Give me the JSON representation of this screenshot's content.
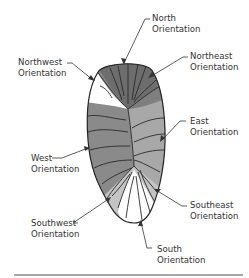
{
  "diagram": {
    "colors": {
      "north": "#6d6d6d",
      "northwest": "#ffffff",
      "northeast": "#8e8e8e",
      "west": "#8a8a8a",
      "east": "#a8a8a8",
      "southwest": "#c4c4c4",
      "southeast": "#c4c4c4",
      "south": "#ffffff",
      "outline": "#222222",
      "leader": "#333333",
      "rule": "#555555"
    },
    "labels": {
      "north": {
        "line1": "North",
        "line2": "Orientation"
      },
      "northwest": {
        "line1": "Northwest",
        "line2": "Orientation"
      },
      "northeast": {
        "line1": "Northeast",
        "line2": "Orientation"
      },
      "east": {
        "line1": "East",
        "line2": "Orientation"
      },
      "west": {
        "line1": "West",
        "line2": "Orientation"
      },
      "southeast": {
        "line1": "Southeast",
        "line2": "Orientation"
      },
      "southwest": {
        "line1": "Southwest",
        "line2": "Orientation"
      },
      "south": {
        "line1": "South",
        "line2": "Orientation"
      }
    }
  }
}
